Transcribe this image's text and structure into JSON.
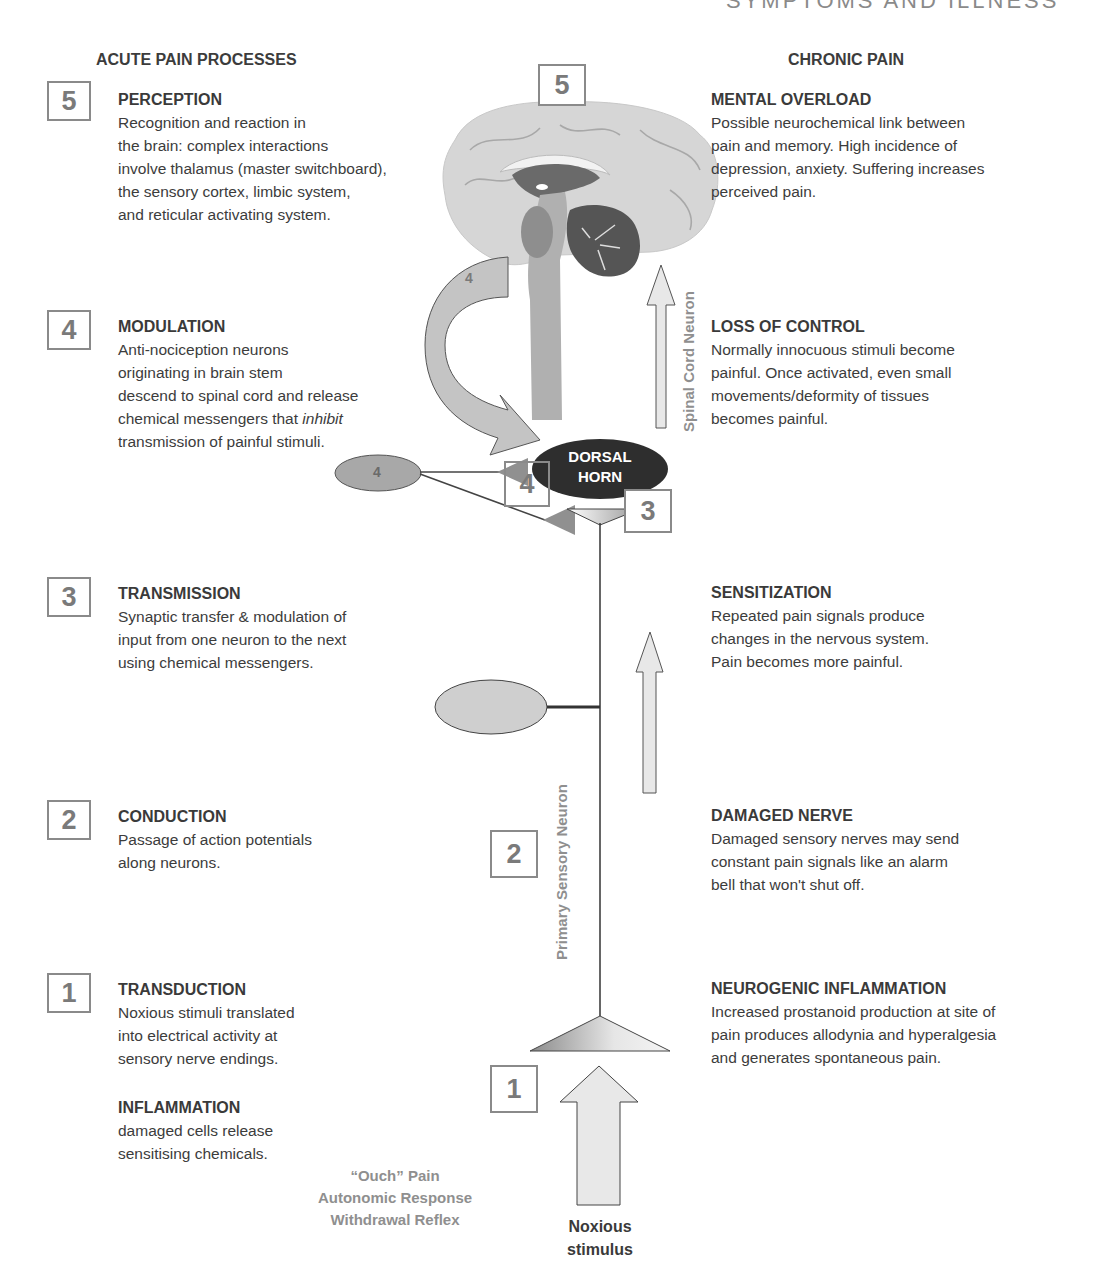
{
  "header": {
    "running_head": "SYMPTOMS AND ILLNESS"
  },
  "columns": {
    "left_title": "ACUTE PAIN PROCESSES",
    "right_title": "CHRONIC PAIN"
  },
  "acute": [
    {
      "step": "5",
      "heading": "PERCEPTION",
      "text": "Recognition and reaction in\nthe brain: complex interactions\ninvolve thalamus (master switchboard),\nthe sensory cortex, limbic system,\nand reticular activating system."
    },
    {
      "step": "4",
      "heading": "MODULATION",
      "text_a": "Anti-nociception neurons\noriginating in brain stem\ndescend to spinal cord and release\nchemical messengers that ",
      "text_em": "inhibit",
      "text_b": "\ntransmission of painful stimuli."
    },
    {
      "step": "3",
      "heading": "TRANSMISSION",
      "text": "Synaptic transfer & modulation of\ninput from one neuron to the next\nusing chemical messengers."
    },
    {
      "step": "2",
      "heading": "CONDUCTION",
      "text": "Passage of action potentials\nalong neurons."
    },
    {
      "step": "1",
      "heading": "TRANSDUCTION",
      "text": "Noxious stimuli translated\ninto electrical activity at\nsensory nerve endings."
    },
    {
      "heading": "INFLAMMATION",
      "text": "damaged cells release\nsensitising chemicals."
    }
  ],
  "chronic": [
    {
      "heading": "MENTAL OVERLOAD",
      "text": "Possible neurochemical link between\npain and memory. High incidence of\ndepression, anxiety. Suffering increases\nperceived pain."
    },
    {
      "heading": "LOSS OF CONTROL",
      "text": "Normally innocuous stimuli become\npainful. Once activated, even small\nmovements/deformity of tissues\nbecomes painful."
    },
    {
      "heading": "SENSITIZATION",
      "text": "Repeated pain signals produce\nchanges in the nervous system.\nPain becomes more painful."
    },
    {
      "heading": "DAMAGED NERVE",
      "text": "Damaged sensory nerves may send\nconstant pain signals like an alarm\nbell that won't shut off."
    },
    {
      "heading": "NEUROGENIC INFLAMMATION",
      "text": "Increased prostanoid production at site of\npain produces allodynia and hyperalgesia\nand generates spontaneous pain."
    }
  ],
  "diagram": {
    "brain_step": "5",
    "arrow_step": "4",
    "ellipse_step": "4",
    "synapse_step_4": "4",
    "synapse_step_3": "3",
    "conduction_step": "2",
    "transduction_step": "1",
    "dorsal_horn": "DORSAL\nHORN",
    "spinal_cord_label": "Spinal Cord Neuron",
    "primary_sensory_label": "Primary Sensory Neuron",
    "responses": [
      "“Ouch” Pain",
      "Autonomic Response",
      "Withdrawal Reflex"
    ],
    "stimulus": "Noxious\nstimulus"
  },
  "colors": {
    "text": "#3a3a3a",
    "box_border": "#8a8a8a",
    "brain_light": "#d4d4d4",
    "brain_dark": "#555555",
    "dorsal_horn": "#2e2e2e",
    "arrow_fill": "#e8e8e8",
    "label_gray": "#8f8f8f"
  }
}
